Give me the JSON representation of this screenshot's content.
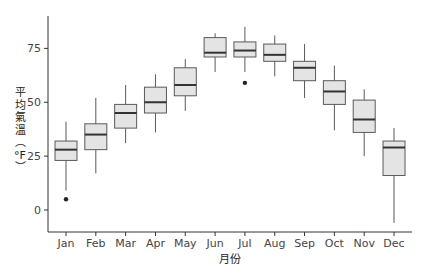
{
  "chart_data": {
    "type": "boxplot",
    "title": "",
    "xlabel": "月份",
    "ylabel": "平均氣溫（°F）",
    "ylabel_chars": [
      "平",
      "均",
      "氣",
      "溫",
      "︵",
      "°F",
      "︶"
    ],
    "categories": [
      "Jan",
      "Feb",
      "Mar",
      "Apr",
      "May",
      "Jun",
      "Jul",
      "Aug",
      "Sep",
      "Oct",
      "Nov",
      "Dec"
    ],
    "yticks": [
      0,
      25,
      50,
      75
    ],
    "ylim": [
      -10,
      90
    ],
    "grid": false,
    "legend": null,
    "boxes": [
      {
        "month": "Jan",
        "whisker_low": 9,
        "q1": 23,
        "median": 28,
        "q3": 32,
        "whisker_high": 41,
        "outliers": [
          5
        ]
      },
      {
        "month": "Feb",
        "whisker_low": 17,
        "q1": 28,
        "median": 35,
        "q3": 40,
        "whisker_high": 52,
        "outliers": []
      },
      {
        "month": "Mar",
        "whisker_low": 31,
        "q1": 38,
        "median": 45,
        "q3": 49,
        "whisker_high": 58,
        "outliers": []
      },
      {
        "month": "Apr",
        "whisker_low": 36,
        "q1": 45,
        "median": 50,
        "q3": 57,
        "whisker_high": 63,
        "outliers": []
      },
      {
        "month": "May",
        "whisker_low": 46,
        "q1": 53,
        "median": 58,
        "q3": 66,
        "whisker_high": 70,
        "outliers": []
      },
      {
        "month": "Jun",
        "whisker_low": 64,
        "q1": 71,
        "median": 73,
        "q3": 80,
        "whisker_high": 82,
        "outliers": []
      },
      {
        "month": "Jul",
        "whisker_low": 64,
        "q1": 71,
        "median": 74,
        "q3": 78,
        "whisker_high": 85,
        "outliers": [
          59
        ]
      },
      {
        "month": "Aug",
        "whisker_low": 62,
        "q1": 69,
        "median": 72,
        "q3": 77,
        "whisker_high": 81,
        "outliers": []
      },
      {
        "month": "Sep",
        "whisker_low": 52,
        "q1": 60,
        "median": 66,
        "q3": 69,
        "whisker_high": 77,
        "outliers": []
      },
      {
        "month": "Oct",
        "whisker_low": 37,
        "q1": 49,
        "median": 55,
        "q3": 60,
        "whisker_high": 67,
        "outliers": []
      },
      {
        "month": "Nov",
        "whisker_low": 25,
        "q1": 36,
        "median": 42,
        "q3": 51,
        "whisker_high": 56,
        "outliers": []
      },
      {
        "month": "Dec",
        "whisker_low": -6,
        "q1": 16,
        "median": 29,
        "q3": 32,
        "whisker_high": 38,
        "outliers": []
      }
    ],
    "colors": {
      "box_fill": "#e4e4e4",
      "box_stroke": "#5a5a5a",
      "median": "#333333",
      "whisker": "#5a5a5a",
      "outlier": "#222222",
      "axis": "#333333"
    }
  }
}
